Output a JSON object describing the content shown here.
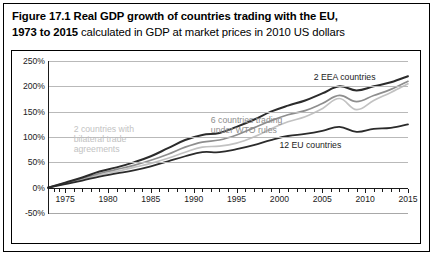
{
  "caption": {
    "bold_lead": "Figure 17.1 Real GDP growth of countries trading with the EU, 1973 to 2015",
    "line1_bold": "Figure 17.1 Real GDP growth of countries trading with the EU,",
    "line2_bold": "1973 to 2015",
    "line2_regular": " calculated in GDP at market prices in 2010 US dollars"
  },
  "chart_data": {
    "type": "line",
    "title": "Figure 17.1 Real GDP growth of countries trading with the EU, 1973 to 2015 calculated in GDP at market prices in 2010 US dollars",
    "subtitle": "calculated in GDP at market prices in 2010 US dollars",
    "xlabel": "",
    "ylabel": "",
    "xlim": [
      1973,
      2015
    ],
    "ylim": [
      -50,
      250
    ],
    "ytick_labels": [
      "250%",
      "200%",
      "150%",
      "100%",
      "50%",
      "0%",
      "-50%"
    ],
    "ytick_values": [
      250,
      200,
      150,
      100,
      50,
      0,
      -50
    ],
    "xtick_labels": [
      "1975",
      "1980",
      "1985",
      "1990",
      "1995",
      "2000",
      "2005",
      "2010",
      "2015"
    ],
    "xtick_values": [
      1975,
      1980,
      1985,
      1990,
      1995,
      2000,
      2005,
      2010,
      2015
    ],
    "y_unit": "percent",
    "grid": "horizontal",
    "legend_position": "inline-annotations",
    "minor_ticks_per_interval": 5,
    "x": [
      1973,
      1975,
      1977,
      1979,
      1981,
      1983,
      1985,
      1987,
      1989,
      1991,
      1993,
      1995,
      1997,
      1999,
      2001,
      2003,
      2005,
      2007,
      2009,
      2011,
      2013,
      2015
    ],
    "series": [
      {
        "name": "2 EEA countries",
        "color": "#2b2b2b",
        "width": 2.0,
        "label_x": 2004,
        "label_y": 218,
        "values": [
          0,
          10,
          20,
          32,
          40,
          50,
          62,
          78,
          94,
          104,
          108,
          120,
          134,
          150,
          162,
          172,
          186,
          200,
          192,
          200,
          208,
          220
        ]
      },
      {
        "name": "6 countries trading under WTO rules",
        "color": "#8e8e8e",
        "width": 1.7,
        "label_x": 1992,
        "label_y": 124,
        "values": [
          0,
          9,
          18,
          28,
          36,
          44,
          54,
          66,
          80,
          90,
          94,
          104,
          118,
          132,
          144,
          152,
          166,
          182,
          170,
          182,
          194,
          210
        ]
      },
      {
        "name": "2 countries with bilateral trade agreements",
        "color": "#c2c2c2",
        "width": 1.7,
        "label_x": 1976,
        "label_y": 96,
        "values": [
          0,
          8,
          16,
          25,
          32,
          40,
          48,
          58,
          70,
          80,
          82,
          88,
          100,
          116,
          130,
          140,
          156,
          176,
          154,
          172,
          188,
          205
        ]
      },
      {
        "name": "12 EU countries",
        "color": "#2b2b2b",
        "width": 1.8,
        "label_x": 2000,
        "label_y": 84,
        "values": [
          0,
          7,
          14,
          22,
          28,
          34,
          42,
          52,
          62,
          70,
          70,
          76,
          84,
          94,
          102,
          106,
          112,
          120,
          110,
          116,
          118,
          125
        ]
      }
    ],
    "annotations": [
      {
        "text": "2 EEA countries",
        "color": "#1a1a1a"
      },
      {
        "text": "6 countries trading",
        "color": "#8e8e8e"
      },
      {
        "text": "under WTO rules",
        "color": "#8e8e8e"
      },
      {
        "text": "2 countries with",
        "color": "#c2c2c2"
      },
      {
        "text": "bilateral trade",
        "color": "#c2c2c2"
      },
      {
        "text": "agreements",
        "color": "#c2c2c2"
      },
      {
        "text": "12 EU countries",
        "color": "#1a1a1a"
      }
    ]
  }
}
